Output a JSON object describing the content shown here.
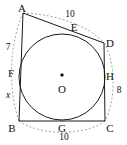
{
  "figure": {
    "type": "geometry-diagram",
    "colors": {
      "stroke": "#1a1a1a",
      "dashed": "#8a8a8a",
      "background": "#ffffff",
      "center_dot": "#000000"
    },
    "vertices": [
      {
        "name": "A",
        "label": "A",
        "x": 23,
        "y": 13,
        "label_x": 22,
        "label_y": 8
      },
      {
        "name": "B",
        "label": "B",
        "x": 19,
        "y": 121,
        "label_x": 12,
        "label_y": 128
      },
      {
        "name": "C",
        "label": "C",
        "x": 105,
        "y": 121,
        "label_x": 110,
        "label_y": 128
      },
      {
        "name": "D",
        "label": "D",
        "x": 104,
        "y": 43,
        "label_x": 110,
        "label_y": 43
      }
    ],
    "tangent_points": [
      {
        "name": "E",
        "label": "E",
        "x": 72,
        "y": 33,
        "label_x": 74,
        "label_y": 27
      },
      {
        "name": "F",
        "label": "F",
        "x": 19,
        "y": 73,
        "label_x": 11,
        "label_y": 73
      },
      {
        "name": "G",
        "label": "G",
        "x": 62,
        "y": 121,
        "label_x": 62,
        "label_y": 128
      },
      {
        "name": "H",
        "label": "H",
        "x": 105,
        "y": 77,
        "label_x": 110,
        "label_y": 76
      }
    ],
    "circle": {
      "label": "O",
      "center_x": 62,
      "center_y": 77,
      "radius": 43,
      "label_x": 62,
      "label_y": 89,
      "dot_x": 62,
      "dot_y": 75
    },
    "measures": [
      {
        "name": "side-AF",
        "value": "7",
        "x": 8,
        "y": 48,
        "italic": false
      },
      {
        "name": "side-FB",
        "value": "x",
        "x": 8,
        "y": 96,
        "italic": true
      },
      {
        "name": "side-AD",
        "value": "10",
        "x": 70,
        "y": 15,
        "italic": false
      },
      {
        "name": "side-DC",
        "value": "8",
        "x": 119,
        "y": 91,
        "italic": false
      },
      {
        "name": "side-BC",
        "value": "10",
        "x": 64,
        "y": 138,
        "italic": false
      }
    ]
  }
}
